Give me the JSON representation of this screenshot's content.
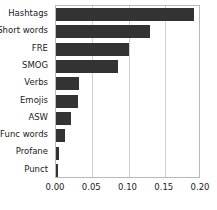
{
  "chart_data": {
    "type": "bar",
    "orientation": "horizontal",
    "title": "",
    "xlabel": "",
    "ylabel": "",
    "categories": [
      "Hashtags",
      "Short words",
      "FRE",
      "SMOG",
      "Verbs",
      "Emojis",
      "ASW",
      "Func words",
      "Profane",
      "Punct"
    ],
    "values": [
      0.19,
      0.129,
      0.101,
      0.085,
      0.032,
      0.031,
      0.021,
      0.012,
      0.004,
      0.003
    ],
    "xlim": [
      0.0,
      0.2
    ],
    "xticks": [
      0.0,
      0.05,
      0.1,
      0.15,
      0.2
    ],
    "xticklabels": [
      "0.00",
      "0.05",
      "0.10",
      "0.15",
      "0.20"
    ],
    "grid": "vertical",
    "legend": "none",
    "bar_color": "#333333",
    "gridline_color": "#cfcfcf",
    "background_color": "#ffffff"
  }
}
